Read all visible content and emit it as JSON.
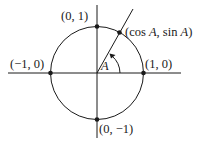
{
  "diagram": {
    "center": {
      "x": 97,
      "y": 73
    },
    "radius": 46.5,
    "colors": {
      "stroke": "#1a1a1a",
      "background": "#ffffff"
    },
    "points": [
      {
        "id": "top",
        "label": "(0, 1)"
      },
      {
        "id": "bottom",
        "label": "(0, −1)"
      },
      {
        "id": "left",
        "label": "(−1, 0)"
      },
      {
        "id": "right",
        "label": "(1, 0)"
      },
      {
        "id": "angle-point",
        "label_prefix": "(cos ",
        "label_var1": "A",
        "label_mid": ", sin ",
        "label_var2": "A",
        "label_suffix": ")"
      }
    ],
    "angle": {
      "label": "A"
    }
  }
}
